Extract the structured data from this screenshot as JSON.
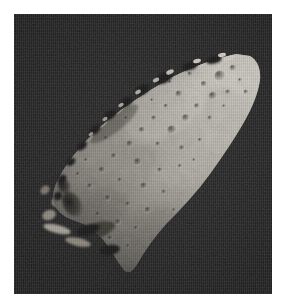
{
  "page": {
    "background_color": "#ffffff",
    "width": 286,
    "height": 308
  },
  "plate": {
    "name": "asteroid-photograph",
    "frame": {
      "left": 14,
      "top": 14,
      "width": 258,
      "height": 280
    },
    "sky_color": "#1f1f1f",
    "sky_color_light": "#252525",
    "sky_color_dark": "#191919",
    "caption": ""
  },
  "subject": {
    "name": "asteroid",
    "description": "Irregular elongated cratered asteroid lit from the upper right",
    "shape": "elongated wedge oriented upper-right to lower-left",
    "illumination_direction": "upper-right",
    "colors": {
      "highlight": "#d2cdc4",
      "bright": "#bfbab1",
      "mid": "#a49f96",
      "mid_dark": "#8b867d",
      "shadow": "#5d5951",
      "deep_shadow": "#3a3832",
      "terminator": "#2a2925"
    },
    "outline_points": "238,44 244,52 246,66 241,84 233,104 221,124 206,146 191,166 176,184 160,200 143,218 128,236 116,250 108,248 100,236 92,222 80,212 66,206 54,200 46,192 42,180 46,166 54,152 62,140 72,128 84,116 96,104 110,94 124,84 138,74 152,64 166,56 180,50 194,46 208,42 222,40",
    "fragments": [
      {
        "name": "ridge-fragment-upper",
        "cx": 46,
        "cy": 186,
        "rx": 9,
        "ry": 6,
        "tone": "#9b968d"
      },
      {
        "name": "ridge-fragment-mid",
        "cx": 36,
        "cy": 200,
        "rx": 7,
        "ry": 5,
        "tone": "#8e8980"
      },
      {
        "name": "ridge-fragment-lower",
        "cx": 42,
        "cy": 214,
        "rx": 14,
        "ry": 4,
        "tone": "#a09b92"
      },
      {
        "name": "ridge-fragment-tail",
        "cx": 62,
        "cy": 226,
        "rx": 12,
        "ry": 4,
        "tone": "#8a857c"
      }
    ],
    "craters": [
      {
        "cx": 206,
        "cy": 62,
        "r": 5.5
      },
      {
        "cx": 219,
        "cy": 54,
        "r": 3.2
      },
      {
        "cx": 190,
        "cy": 70,
        "r": 3.0
      },
      {
        "cx": 176,
        "cy": 60,
        "r": 2.4
      },
      {
        "cx": 199,
        "cy": 82,
        "r": 4.2
      },
      {
        "cx": 214,
        "cy": 78,
        "r": 2.6
      },
      {
        "cx": 183,
        "cy": 92,
        "r": 2.8
      },
      {
        "cx": 165,
        "cy": 80,
        "r": 3.4
      },
      {
        "cx": 152,
        "cy": 92,
        "r": 2.2
      },
      {
        "cx": 172,
        "cy": 104,
        "r": 3.8
      },
      {
        "cx": 196,
        "cy": 104,
        "r": 2.4
      },
      {
        "cx": 158,
        "cy": 116,
        "r": 4.6
      },
      {
        "cx": 140,
        "cy": 104,
        "r": 2.6
      },
      {
        "cx": 128,
        "cy": 116,
        "r": 3.0
      },
      {
        "cx": 144,
        "cy": 130,
        "r": 2.4
      },
      {
        "cx": 168,
        "cy": 134,
        "r": 2.8
      },
      {
        "cx": 186,
        "cy": 126,
        "r": 2.2
      },
      {
        "cx": 116,
        "cy": 130,
        "r": 3.4
      },
      {
        "cx": 100,
        "cy": 142,
        "r": 2.8
      },
      {
        "cx": 124,
        "cy": 148,
        "r": 4.0
      },
      {
        "cx": 146,
        "cy": 156,
        "r": 2.6
      },
      {
        "cx": 166,
        "cy": 152,
        "r": 2.2
      },
      {
        "cx": 88,
        "cy": 156,
        "r": 3.2
      },
      {
        "cx": 106,
        "cy": 166,
        "r": 2.4
      },
      {
        "cx": 130,
        "cy": 172,
        "r": 3.6
      },
      {
        "cx": 150,
        "cy": 178,
        "r": 2.4
      },
      {
        "cx": 76,
        "cy": 172,
        "r": 2.8
      },
      {
        "cx": 94,
        "cy": 184,
        "r": 3.0
      },
      {
        "cx": 114,
        "cy": 190,
        "r": 2.6
      },
      {
        "cx": 134,
        "cy": 196,
        "r": 3.2
      },
      {
        "cx": 84,
        "cy": 200,
        "r": 2.4
      },
      {
        "cx": 104,
        "cy": 208,
        "r": 3.0
      },
      {
        "cx": 122,
        "cy": 214,
        "r": 2.2
      },
      {
        "cx": 96,
        "cy": 224,
        "r": 2.6
      },
      {
        "cx": 114,
        "cy": 232,
        "r": 2.0
      },
      {
        "cx": 64,
        "cy": 160,
        "r": 2.2
      },
      {
        "cx": 226,
        "cy": 66,
        "r": 2.0
      },
      {
        "cx": 232,
        "cy": 78,
        "r": 2.4
      }
    ],
    "shadow_patches": [
      {
        "name": "large-crater-shadow",
        "cx": 58,
        "cy": 190,
        "rx": 9,
        "ry": 13,
        "rot": -28
      },
      {
        "name": "limb-shadow-upper-left",
        "cx": 96,
        "cy": 112,
        "rx": 34,
        "ry": 11,
        "rot": -38
      },
      {
        "name": "lower-terminator-shadow",
        "cx": 78,
        "cy": 218,
        "rx": 26,
        "ry": 9,
        "rot": -20
      }
    ]
  }
}
